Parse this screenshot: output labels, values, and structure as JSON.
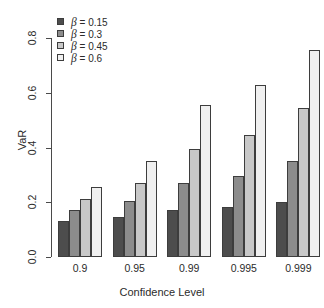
{
  "chart_data": {
    "type": "bar",
    "title": "",
    "xlabel": "Confidence Level",
    "ylabel": "VaR",
    "categories": [
      "0.9",
      "0.95",
      "0.99",
      "0.995",
      "0.999"
    ],
    "series": [
      {
        "name": "β = 0.15",
        "beta": "0.15",
        "color": "#4d4d4d",
        "values": [
          0.131,
          0.146,
          0.171,
          0.182,
          0.201
        ]
      },
      {
        "name": "β = 0.3",
        "beta": "0.3",
        "color": "#8c8c8c",
        "values": [
          0.171,
          0.204,
          0.27,
          0.296,
          0.35
        ]
      },
      {
        "name": "β = 0.45",
        "beta": "0.45",
        "color": "#c8c8c8",
        "values": [
          0.212,
          0.27,
          0.394,
          0.445,
          0.544
        ]
      },
      {
        "name": "β = 0.6",
        "beta": "0.6",
        "color": "#f0f0f0",
        "values": [
          0.256,
          0.35,
          0.555,
          0.628,
          0.755
        ]
      }
    ],
    "ylim": [
      0.0,
      0.8
    ],
    "yticks": [
      "0.0",
      "0.2",
      "0.4",
      "0.6",
      "0.8"
    ],
    "ytick_values": [
      0.0,
      0.2,
      0.4,
      0.6,
      0.8
    ],
    "grid": false,
    "legend_position": "top-left",
    "bar_border_color": "#3d3d3d",
    "axis_color": "#4a4a4a"
  },
  "legend": {
    "entries": [
      {
        "symbol": "β",
        "label": "= 0.15"
      },
      {
        "symbol": "β",
        "label": "= 0.3"
      },
      {
        "symbol": "β",
        "label": "= 0.45"
      },
      {
        "symbol": "β",
        "label": "= 0.6"
      }
    ]
  }
}
